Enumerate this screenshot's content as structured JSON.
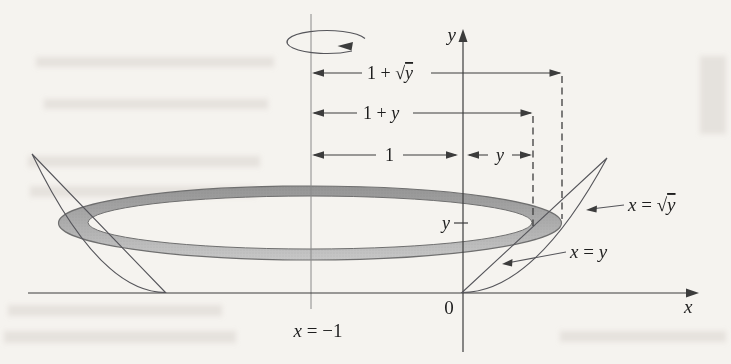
{
  "figure": {
    "title_hint": "Solid of revolution: region between x = y and x = √y rotated about the line x = −1 (washer of inner radius 1 + y, outer radius 1 + √y)",
    "axes": {
      "x_label": "x",
      "y_label": "y",
      "origin_label": "0"
    },
    "rotation_axis": {
      "var": "x",
      "rest": " = −1"
    },
    "dims": {
      "outer": {
        "p1": "1 + ",
        "rad": "√",
        "var": "y"
      },
      "inner": {
        "p1": "1 + ",
        "var": "y"
      },
      "one": "1",
      "offset": "y",
      "height_tick": "y"
    },
    "curves": {
      "sqrt": {
        "var1": "x",
        "eq": " = ",
        "rad": "√",
        "var2": "y"
      },
      "line": {
        "var1": "x",
        "eq": " = ",
        "var2": "y"
      }
    },
    "colors": {
      "paper": "#f5f3ef",
      "ring_top": "#949494",
      "ring_mid": "#adadad",
      "ring_bottom": "#c9c9c9",
      "ink": "#3c3c3c"
    }
  }
}
